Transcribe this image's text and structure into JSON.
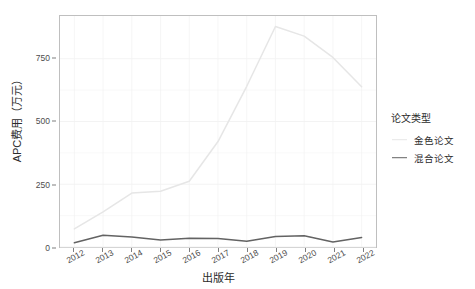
{
  "chart_data": {
    "type": "line",
    "title": "",
    "xlabel": "出版年",
    "ylabel": "APC费用（万元）",
    "x": [
      2012,
      2013,
      2014,
      2015,
      2016,
      2017,
      2018,
      2019,
      2020,
      2021,
      2022
    ],
    "categories": [
      "2012",
      "2013",
      "2014",
      "2015",
      "2016",
      "2017",
      "2018",
      "2019",
      "2020",
      "2021",
      "2022"
    ],
    "series": [
      {
        "name": "金色论文",
        "color": "#e6e6e6",
        "values": [
          72,
          140,
          215,
          222,
          262,
          420,
          640,
          878,
          840,
          755,
          638
        ]
      },
      {
        "name": "混合论文",
        "color": "#636363",
        "values": [
          17,
          47,
          40,
          28,
          35,
          34,
          23,
          42,
          45,
          20,
          38
        ]
      }
    ],
    "xlim": [
      2011.5,
      2022.5
    ],
    "ylim": [
      0,
      920
    ],
    "yticks": [
      0,
      250,
      500,
      750
    ],
    "ytick_labels": [
      "0",
      "250",
      "500",
      "750"
    ],
    "grid": true,
    "grid_color": "#f2f2f2",
    "legend_position": "right",
    "panel_border_color": "#bfbfbf",
    "background": "#ffffff"
  },
  "legend": {
    "title": "论文类型",
    "entries": [
      {
        "label": "金色论文",
        "color": "#e6e6e6"
      },
      {
        "label": "混合论文",
        "color": "#636363"
      }
    ]
  },
  "axes": {
    "y_title": "APC费用（万元）",
    "x_title": "出版年"
  }
}
